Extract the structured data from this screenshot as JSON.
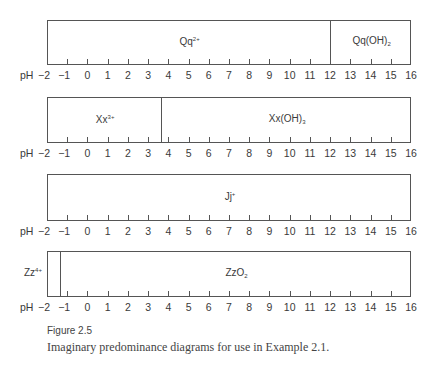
{
  "chart_data": {
    "type": "predominance-diagram",
    "xlabel": "pH",
    "xlim": [
      -2,
      16
    ],
    "ticks": [
      -2,
      -1,
      0,
      1,
      2,
      3,
      4,
      5,
      6,
      7,
      8,
      9,
      10,
      11,
      12,
      13,
      14,
      15,
      16
    ],
    "tick_labels": [
      "−2",
      "−1",
      "0",
      "1",
      "2",
      "3",
      "4",
      "5",
      "6",
      "7",
      "8",
      "9",
      "10",
      "11",
      "12",
      "13",
      "14",
      "15",
      "16"
    ],
    "diagrams": [
      {
        "boundaries": [
          12
        ],
        "regions": [
          {
            "base": "Qq",
            "sup": "2+",
            "sub": "",
            "from": -2,
            "to": 12
          },
          {
            "base": "Qq(OH)",
            "sup": "",
            "sub": "2",
            "from": 12,
            "to": 16
          }
        ]
      },
      {
        "boundaries": [
          3.65
        ],
        "regions": [
          {
            "base": "Xx",
            "sup": "3+",
            "sub": "",
            "from": -2,
            "to": 3.65
          },
          {
            "base": "Xx(OH)",
            "sup": "",
            "sub": "3",
            "from": 3.65,
            "to": 16
          }
        ]
      },
      {
        "boundaries": [],
        "regions": [
          {
            "base": "Jj",
            "sup": "+",
            "sub": "",
            "from": -2,
            "to": 16
          }
        ]
      },
      {
        "boundaries": [
          -1.35
        ],
        "outside_label": {
          "base": "Zz",
          "sup": "4+"
        },
        "regions": [
          {
            "base": "",
            "sup": "",
            "sub": "",
            "from": -2,
            "to": -1.35
          },
          {
            "base": "ZzO",
            "sup": "",
            "sub": "2",
            "from": -1.35,
            "to": 16
          }
        ]
      }
    ]
  },
  "caption": {
    "title": "Figure 2.5",
    "text": "Imaginary predominance diagrams for use in Example 2.1."
  }
}
